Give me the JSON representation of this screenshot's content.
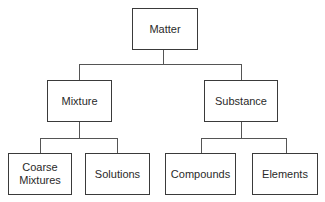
{
  "diagram": {
    "type": "hierarchy",
    "root": {
      "label": "Matter"
    },
    "level1": [
      {
        "label": "Mixture"
      },
      {
        "label": "Substance"
      }
    ],
    "level2": [
      {
        "label": "Coarse\nMixtures",
        "parent": "Mixture"
      },
      {
        "label": "Solutions",
        "parent": "Mixture"
      },
      {
        "label": "Compounds",
        "parent": "Substance"
      },
      {
        "label": "Elements",
        "parent": "Substance"
      }
    ],
    "colors": {
      "border": "#3a3a3a",
      "text": "#2a2a2a",
      "background": "#ffffff"
    }
  }
}
